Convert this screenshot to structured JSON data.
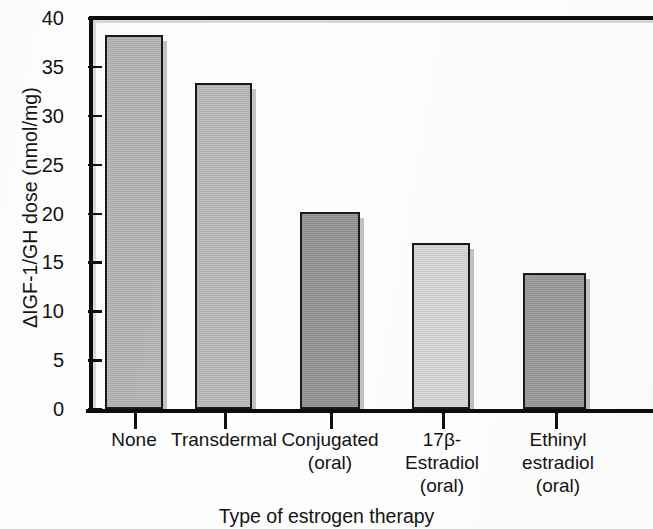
{
  "chart_data": {
    "type": "bar",
    "title": "",
    "subtitle": "",
    "xlabel": "Type of estrogen therapy",
    "ylabel": "ΔIGF-1/GH dose (nmol/mg)",
    "categories": [
      "None",
      "Transdermal",
      "Conjugated (oral)",
      "17β-Estradiol (oral)",
      "Ethinyl estradiol (oral)"
    ],
    "category_lines": [
      [
        "None"
      ],
      [
        "Transdermal"
      ],
      [
        "Conjugated",
        "(oral)"
      ],
      [
        "17β-",
        "Estradiol",
        "(oral)"
      ],
      [
        "Ethinyl",
        "estradiol",
        "(oral)"
      ]
    ],
    "values": [
      38.3,
      33.4,
      20.2,
      17.0,
      13.9
    ],
    "bar_colors": [
      "#b0b0b0",
      "#b4b4b4",
      "#8e8e8e",
      "#d4d4d4",
      "#949494"
    ],
    "ylim": [
      0,
      40
    ],
    "ytick_values": [
      0,
      5,
      10,
      15,
      20,
      25,
      30,
      35,
      40
    ],
    "ytick_labels": [
      "0",
      "5",
      "10",
      "15",
      "20",
      "25",
      "30",
      "35",
      "40"
    ],
    "grid": false,
    "legend": null,
    "legend_position": "none",
    "annotations": []
  },
  "figure": {
    "background_color": "#fefefe",
    "axis_color": "#0d0d0d",
    "text_color": "#141414",
    "plot_background": "#fdfdfd",
    "frame_bevel_color": "#d9d9d9"
  }
}
